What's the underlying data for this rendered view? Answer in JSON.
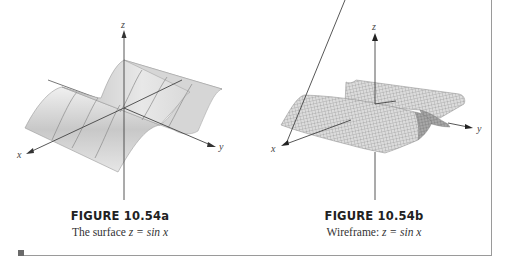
{
  "figures": [
    {
      "id": "a",
      "title": "FIGURE 10.54a",
      "caption_prefix": "The surface ",
      "caption_math": "z = sin x",
      "style": "shaded surface",
      "axes": {
        "x": "x",
        "y": "y",
        "z": "z"
      }
    },
    {
      "id": "b",
      "title": "FIGURE 10.54b",
      "caption_prefix": "Wireframe: ",
      "caption_math": "z = sin x",
      "style": "wireframe",
      "axes": {
        "x": "x",
        "y": "y",
        "z": "z"
      }
    }
  ],
  "colors": {
    "surface_fill": "#d9d9d9",
    "surface_edge": "#8c8c8c",
    "axis": "#444444",
    "border": "#9a9a9a"
  }
}
